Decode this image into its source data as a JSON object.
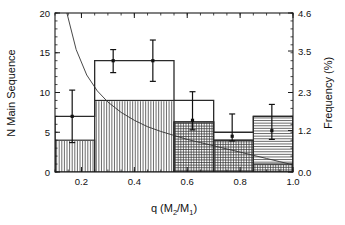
{
  "figure": {
    "title": "",
    "background": "#ffffff",
    "foreground": "#111111"
  },
  "axes": {
    "x": {
      "label_main": "q (M",
      "label_sub1": "2",
      "label_mid": "/M",
      "label_sub2": "1",
      "label_end": ")",
      "label_full": "q (M2/M1)",
      "min": 0.1,
      "max": 1.0,
      "ticks": [
        0.2,
        0.4,
        0.6,
        0.8,
        1.0
      ],
      "tick_labels": [
        "0.2",
        "0.4",
        "0.6",
        "0.8",
        "1.0"
      ],
      "minor_tick_step": 0.05
    },
    "y_left": {
      "label": "N Main Sequence",
      "min": 0,
      "max": 20,
      "ticks": [
        0,
        5,
        10,
        15,
        20
      ],
      "tick_labels": [
        "0",
        "5",
        "10",
        "15",
        "20"
      ],
      "minor_tick_step": 1
    },
    "y_right": {
      "label": "Frequency (%)",
      "min": 0.0,
      "max": 4.6,
      "ticks": [
        0.0,
        1.2,
        2.3,
        3.5,
        4.6
      ],
      "tick_labels": [
        "0.0",
        "1.2",
        "2.3",
        "3.5",
        "4.6"
      ],
      "minor_tick_step": 0.23
    }
  },
  "chart_data": {
    "type": "bar",
    "title": "",
    "xlabel": "q (M2/M1)",
    "ylabel": "N Main Sequence",
    "ylabel_right": "Frequency (%)",
    "xlim": [
      0.1,
      1.0
    ],
    "ylim": [
      0,
      20
    ],
    "ylim_right": [
      0.0,
      4.6
    ],
    "grid": false,
    "legend": "none",
    "bin_edges": [
      0.1,
      0.25,
      0.55,
      0.7,
      0.85,
      1.0
    ],
    "bin_edges_note": "bin 2 spans 0.25-0.55 as a single wide bar",
    "series": [
      {
        "name": "Total (outline histogram)",
        "style": "step-outline",
        "bins": [
          {
            "lo": 0.1,
            "hi": 0.25,
            "value": 7
          },
          {
            "lo": 0.25,
            "hi": 0.55,
            "value": 14
          },
          {
            "lo": 0.55,
            "hi": 0.7,
            "value": 9
          },
          {
            "lo": 0.7,
            "hi": 0.85,
            "value": 5
          },
          {
            "lo": 0.85,
            "hi": 1.0,
            "value": 7
          }
        ],
        "values": [
          7,
          14,
          9,
          5,
          7
        ]
      },
      {
        "name": "Sub-sample (vertical hatch)",
        "style": "vertical-hatch",
        "bins": [
          {
            "lo": 0.1,
            "hi": 0.25,
            "value": 4
          },
          {
            "lo": 0.25,
            "hi": 0.55,
            "value": 9
          },
          {
            "lo": 0.55,
            "hi": 0.7,
            "value": 6.3
          },
          {
            "lo": 0.7,
            "hi": 0.85,
            "value": 4
          },
          {
            "lo": 0.85,
            "hi": 1.0,
            "value": 1
          }
        ],
        "values": [
          4,
          9,
          6.3,
          4,
          1
        ]
      },
      {
        "name": "Sub-sample (horizontal hatch)",
        "style": "horizontal-hatch",
        "bins": [
          {
            "lo": 0.55,
            "hi": 0.7,
            "value": 6.3
          },
          {
            "lo": 0.7,
            "hi": 0.85,
            "value": 4
          },
          {
            "lo": 0.85,
            "hi": 1.0,
            "value": 7
          }
        ],
        "values": [
          6.3,
          4,
          7
        ]
      }
    ],
    "error_bars": [
      {
        "x": 0.165,
        "y": 7.0,
        "lo": 3.7,
        "hi": 10.3
      },
      {
        "x": 0.32,
        "y": 14.0,
        "lo": 12.5,
        "hi": 15.4
      },
      {
        "x": 0.47,
        "y": 14.0,
        "lo": 11.4,
        "hi": 16.6
      },
      {
        "x": 0.62,
        "y": 6.5,
        "lo": 5.3,
        "hi": 10.1
      },
      {
        "x": 0.77,
        "y": 4.5,
        "lo": 3.9,
        "hi": 7.3
      },
      {
        "x": 0.92,
        "y": 5.2,
        "lo": 4.1,
        "hi": 8.5
      }
    ],
    "curve": {
      "name": "power-law decay",
      "description": "smooth monotonically decreasing model curve",
      "points": [
        {
          "x": 0.145,
          "y": 20.0
        },
        {
          "x": 0.18,
          "y": 15.4
        },
        {
          "x": 0.22,
          "y": 12.2
        },
        {
          "x": 0.26,
          "y": 10.2
        },
        {
          "x": 0.3,
          "y": 8.8
        },
        {
          "x": 0.35,
          "y": 7.5
        },
        {
          "x": 0.4,
          "y": 6.5
        },
        {
          "x": 0.45,
          "y": 5.7
        },
        {
          "x": 0.5,
          "y": 5.1
        },
        {
          "x": 0.55,
          "y": 4.6
        },
        {
          "x": 0.6,
          "y": 4.1
        },
        {
          "x": 0.65,
          "y": 3.7
        },
        {
          "x": 0.7,
          "y": 3.3
        },
        {
          "x": 0.75,
          "y": 2.9
        },
        {
          "x": 0.8,
          "y": 2.5
        },
        {
          "x": 0.85,
          "y": 2.1
        },
        {
          "x": 0.9,
          "y": 1.7
        },
        {
          "x": 0.95,
          "y": 1.3
        },
        {
          "x": 1.0,
          "y": 0.9
        }
      ]
    }
  }
}
